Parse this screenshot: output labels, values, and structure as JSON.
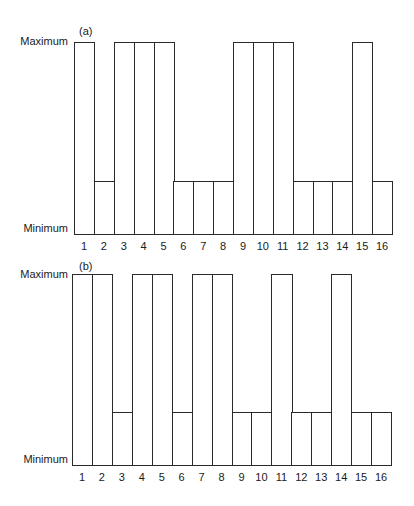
{
  "chart_data": [
    {
      "type": "bar",
      "title": "(a)",
      "xlabel": "",
      "ylabel": "",
      "y_tick_labels": [
        "Minimum",
        "Maximum"
      ],
      "ylim": [
        0,
        1
      ],
      "grid": false,
      "categories": [
        "1",
        "2",
        "3",
        "4",
        "5",
        "6",
        "7",
        "8",
        "9",
        "10",
        "11",
        "12",
        "13",
        "14",
        "15",
        "16"
      ],
      "values": [
        1,
        0.28,
        1,
        1,
        1,
        0.28,
        0.28,
        0.28,
        1,
        1,
        1,
        0.28,
        0.28,
        0.28,
        1,
        0.28
      ]
    },
    {
      "type": "bar",
      "title": "(b)",
      "xlabel": "",
      "ylabel": "",
      "y_tick_labels": [
        "Minimum",
        "Maximum"
      ],
      "ylim": [
        0,
        1
      ],
      "grid": false,
      "categories": [
        "1",
        "2",
        "3",
        "4",
        "5",
        "6",
        "7",
        "8",
        "9",
        "10",
        "11",
        "12",
        "13",
        "14",
        "15",
        "16"
      ],
      "values": [
        1,
        1,
        0.28,
        1,
        1,
        0.28,
        1,
        1,
        0.28,
        0.28,
        1,
        0.28,
        0.28,
        1,
        0.28,
        0.28
      ]
    }
  ],
  "panels": [
    {
      "label": "(a)",
      "y_max_label": "Maximum",
      "y_min_label": "Minimum"
    },
    {
      "label": "(b)",
      "y_max_label": "Maximum",
      "y_min_label": "Minimum"
    }
  ]
}
